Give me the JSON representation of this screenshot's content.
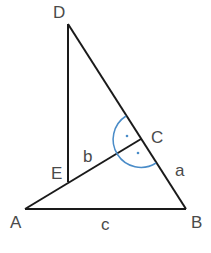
{
  "diagram": {
    "type": "geometry-triangle",
    "points": {
      "A": {
        "label": "A",
        "x": 25,
        "y": 209
      },
      "B": {
        "label": "B",
        "x": 186,
        "y": 209
      },
      "C": {
        "label": "C",
        "x": 141,
        "y": 139
      },
      "D": {
        "label": "D",
        "x": 68,
        "y": 24
      },
      "E": {
        "label": "E",
        "x": 68,
        "y": 182
      }
    },
    "sides": {
      "a": {
        "label": "a",
        "from": "C",
        "to": "B"
      },
      "b": {
        "label": "b",
        "from": "E",
        "to": "C"
      },
      "c": {
        "label": "c",
        "from": "A",
        "to": "B"
      }
    },
    "segments": [
      [
        "A",
        "B"
      ],
      [
        "B",
        "D"
      ],
      [
        "D",
        "E"
      ],
      [
        "A",
        "C"
      ]
    ],
    "right_angle_marker": {
      "vertex": "C",
      "style": "arc-with-dots",
      "color": "#4a8cc8"
    },
    "line_color": "#1a1a1a",
    "label_color": "#4a4a4a"
  }
}
